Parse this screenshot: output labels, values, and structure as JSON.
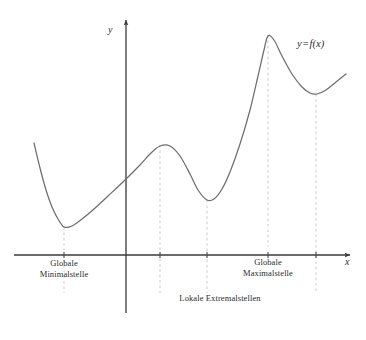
{
  "figure": {
    "background_color": "#ffffff",
    "curve_color": "#6e6e72",
    "axis_color": "#3a3a3a",
    "guide_color": "#cfcfcf",
    "text_color": "#2b2b2b"
  },
  "axes": {
    "x_label": "x",
    "y_label": "y",
    "origin": {
      "x": 126,
      "y": 255
    },
    "x_start": 14,
    "x_end": 356,
    "y_top": 16,
    "y_bottom": 313
  },
  "curve": {
    "label": "y = f(x)",
    "label_parts": {
      "lhs": "y",
      "operator": "=",
      "rhs": "f(x)"
    },
    "label_position": {
      "x": 297,
      "y": 44
    }
  },
  "annotations": [
    {
      "id": "global-minimum",
      "text": "Globale\nMinimalstelle",
      "x_center": 64,
      "y_top": 258,
      "marker_x": 64,
      "marker_y": 227
    },
    {
      "id": "global-maximum",
      "text": "Globale\nMaximalstelle",
      "x_center": 268,
      "y_top": 257,
      "marker_x": 268,
      "marker_y": 35
    },
    {
      "id": "local-extrema",
      "text": "Lokale Extremalstellen",
      "x_center": 220,
      "y_top": 293
    }
  ],
  "chart_data": {
    "type": "line",
    "title": "",
    "xlabel": "x",
    "ylabel": "y",
    "grid": false,
    "legend": "none",
    "series": [
      {
        "name": "y = f(x)",
        "points_px": [
          [
            34,
            143
          ],
          [
            40,
            168
          ],
          [
            46,
            190
          ],
          [
            52,
            207
          ],
          [
            58,
            219
          ],
          [
            64,
            227
          ],
          [
            72,
            226
          ],
          [
            82,
            219
          ],
          [
            94,
            209
          ],
          [
            108,
            196
          ],
          [
            124,
            181
          ],
          [
            140,
            165
          ],
          [
            150,
            154
          ],
          [
            160,
            146
          ],
          [
            170,
            146
          ],
          [
            180,
            156
          ],
          [
            190,
            174
          ],
          [
            198,
            190
          ],
          [
            207,
            200
          ],
          [
            214,
            199
          ],
          [
            222,
            189
          ],
          [
            230,
            172
          ],
          [
            240,
            144
          ],
          [
            250,
            110
          ],
          [
            258,
            76
          ],
          [
            264,
            50
          ],
          [
            268,
            36
          ],
          [
            274,
            40
          ],
          [
            282,
            56
          ],
          [
            292,
            74
          ],
          [
            302,
            87
          ],
          [
            310,
            93
          ],
          [
            317,
            94
          ],
          [
            326,
            90
          ],
          [
            336,
            82
          ],
          [
            346,
            74
          ]
        ]
      }
    ],
    "critical_points": [
      {
        "label": "Globale Minimalstelle",
        "kind": "global-minimum",
        "x_px": 64,
        "y_px": 227
      },
      {
        "label": "Lokale Maximalstelle",
        "kind": "local-maximum",
        "x_px": 160,
        "y_px": 145
      },
      {
        "label": "Lokale Minimalstelle",
        "kind": "local-minimum",
        "x_px": 207,
        "y_px": 200
      },
      {
        "label": "Globale Maximalstelle",
        "kind": "global-maximum",
        "x_px": 268,
        "y_px": 35
      },
      {
        "label": "Lokale Minimalstelle",
        "kind": "local-minimum",
        "x_px": 316,
        "y_px": 94
      }
    ],
    "guide_lines_x_px": [
      64,
      160,
      207,
      268,
      316
    ]
  }
}
